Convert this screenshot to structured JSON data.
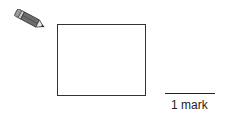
{
  "question": {
    "icon": "pencil-icon",
    "answer_box": {
      "value": ""
    },
    "marks": {
      "label": "1 mark"
    }
  },
  "colors": {
    "background": "#ffffff",
    "ink": "#333333"
  }
}
